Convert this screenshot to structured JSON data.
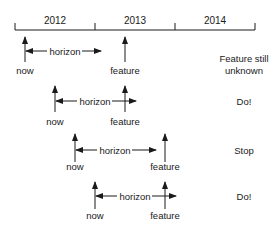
{
  "timeline": {
    "years": [
      "2012",
      "2013",
      "2014"
    ]
  },
  "scenarios": [
    {
      "now_label": "now",
      "feature_label": "feature",
      "horizon_label": "horizon",
      "outcome_line1": "Feature still",
      "outcome_line2": "unknown"
    },
    {
      "now_label": "now",
      "feature_label": "feature",
      "horizon_label": "horizon",
      "outcome_line1": "Do!"
    },
    {
      "now_label": "now",
      "feature_label": "feature",
      "horizon_label": "horizon",
      "outcome_line1": "Stop"
    },
    {
      "now_label": "now",
      "feature_label": "feature",
      "horizon_label": "horizon",
      "outcome_line1": "Do!"
    }
  ],
  "colors": {
    "ink": "#1a1a1a",
    "background": "#ffffff"
  }
}
